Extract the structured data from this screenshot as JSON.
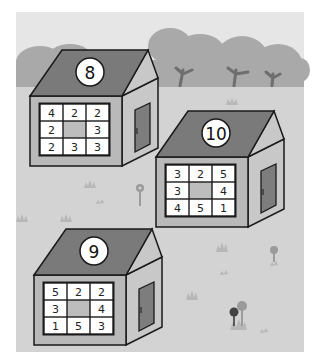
{
  "scene": {
    "colors": {
      "sky": "#e6e6e6",
      "ground": "#d3d3d3",
      "trees": "#a9a9a9",
      "trunks": "#6e6e6e",
      "roof": "#7a7a7a",
      "wall": "#b9b9b9",
      "side_wall": "#c8c8c8",
      "door": "#7d7d7d",
      "cell": "#ffffff",
      "center_cell": "#bdbdbd",
      "outline": "#1a1a1a",
      "grass": "#b7b7b7",
      "flower": "#9a9a9a",
      "flower_dark": "#444444"
    }
  },
  "houses": [
    {
      "id": "house-8",
      "roof_number": "8",
      "grid": [
        [
          "4",
          "2",
          "2"
        ],
        [
          "2",
          "",
          "3"
        ],
        [
          "2",
          "3",
          "3"
        ]
      ]
    },
    {
      "id": "house-10",
      "roof_number": "10",
      "grid": [
        [
          "3",
          "2",
          "5"
        ],
        [
          "3",
          "",
          "4"
        ],
        [
          "4",
          "5",
          "1"
        ]
      ]
    },
    {
      "id": "house-9",
      "roof_number": "9",
      "grid": [
        [
          "5",
          "2",
          "2"
        ],
        [
          "3",
          "",
          "4"
        ],
        [
          "1",
          "5",
          "3"
        ]
      ]
    }
  ]
}
